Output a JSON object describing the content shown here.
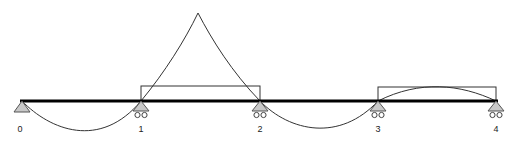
{
  "diagram": {
    "type": "continuous-beam-influence-line",
    "supports": [
      {
        "label": "0",
        "x": 22,
        "kind": "pin"
      },
      {
        "label": "1",
        "x": 141,
        "kind": "roller"
      },
      {
        "label": "2",
        "x": 260,
        "kind": "roller"
      },
      {
        "label": "3",
        "x": 378,
        "kind": "roller"
      },
      {
        "label": "4",
        "x": 496,
        "kind": "roller"
      }
    ],
    "beam_y": 101,
    "load_boxes": [
      {
        "from_support": "1",
        "to_support": "2"
      },
      {
        "from_support": "3",
        "to_support": "4"
      }
    ],
    "colors": {
      "beam": "#000000",
      "support_fill": "#c8c8c8",
      "line": "#333333"
    }
  }
}
